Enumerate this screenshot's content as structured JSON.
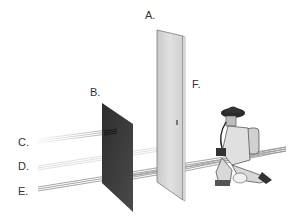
{
  "diagram": {
    "labels": {
      "a": "A.",
      "b": "B.",
      "c": "C.",
      "d": "D.",
      "e": "E.",
      "f": "F."
    },
    "elements": {
      "barrier_a": "tall light panel (door-like board)",
      "barrier_b": "dark opaque panel",
      "beam_c": "beam stopped at panel B",
      "beam_d": "beam passing B, stopped at panel A",
      "beam_e": "beam passing both panels to the firefighter",
      "figure": "kneeling firefighter with SCBA"
    },
    "colors": {
      "panel_a": "#d8d8d8",
      "panel_b": "#3a3a3a",
      "beam": "#9a9a9a",
      "text": "#333333"
    }
  }
}
